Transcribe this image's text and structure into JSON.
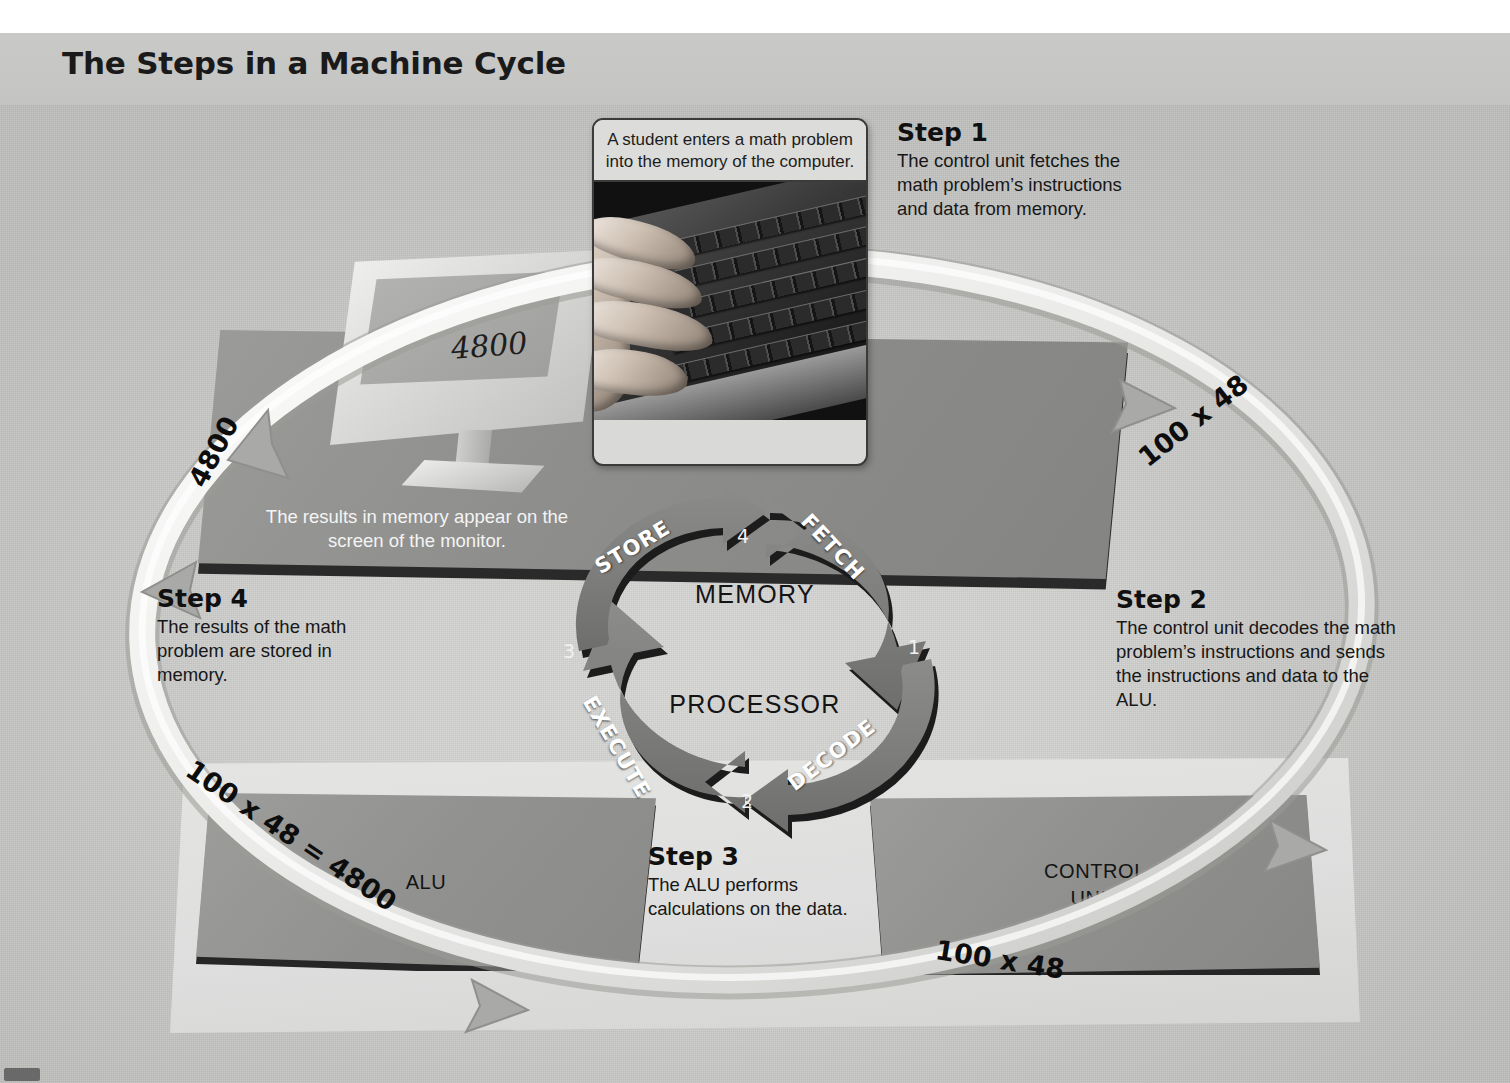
{
  "title": "The Steps in a Machine Cycle",
  "photo_card": {
    "caption": "A student enters a math problem into the memory of the computer.",
    "image_name": "hands-typing-on-keyboard-photo"
  },
  "monitor": {
    "screen_value": "4800",
    "caption": "The results in memory appear on the screen of the monitor."
  },
  "components": {
    "memory_label": "MEMORY",
    "processor_label": "PROCESSOR",
    "alu_label": "ALU",
    "control_unit_label_line1": "CONTROL",
    "control_unit_label_line2": "UNIT"
  },
  "cycle": {
    "arrows": [
      {
        "word": "FETCH",
        "number": "1"
      },
      {
        "word": "DECODE",
        "number": "2"
      },
      {
        "word": "EXECUTE",
        "number": "3"
      },
      {
        "word": "STORE",
        "number": "4"
      }
    ]
  },
  "data_ribbon_labels": {
    "top_right": "100 x 48",
    "bottom_right": "100 x 48",
    "bottom_left": "100 x 48 = 4800",
    "top_left": "4800"
  },
  "steps": [
    {
      "heading": "Step 1",
      "body": "The control unit fetches the math problem’s instructions and data from memory."
    },
    {
      "heading": "Step 2",
      "body": "The control unit decodes the math problem’s instructions and sends the instructions and data to the ALU."
    },
    {
      "heading": "Step 3",
      "body": "The ALU performs calculations on the data."
    },
    {
      "heading": "Step 4",
      "body": "The results of the math problem are stored in memory."
    }
  ],
  "colors": {
    "page_background": "#ffffff",
    "panel_background": "#d2d2d0",
    "arrow_fill": "#7d7d7b",
    "arrow_shadow": "#1c1c1c",
    "slab_gray": "#929290",
    "text_dark": "#141414",
    "text_light": "#f4f4f4"
  }
}
